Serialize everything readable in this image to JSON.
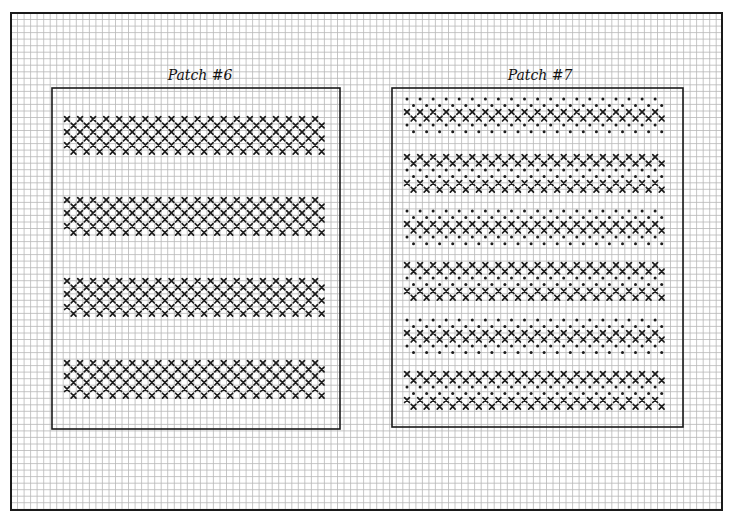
{
  "sheet": {
    "grid_cell_px": 6.53,
    "grid_color": "#b8b8b8",
    "border_color": "#1a1a1a",
    "stitch_color": "#1a1a1a"
  },
  "patches": [
    {
      "title": "Patch #6",
      "box": {
        "x": 52,
        "y": 88,
        "w": 288,
        "h": 341
      },
      "title_pos": {
        "x": 200,
        "y": 80
      },
      "stitch_x0": 67,
      "columns": 40,
      "bands": [
        {
          "y0": 119,
          "rows": [
            "X",
            "X",
            "X",
            "X",
            "X",
            "X"
          ]
        },
        {
          "y0": 200,
          "rows": [
            "X",
            "X",
            "X",
            "X",
            "X",
            "X"
          ]
        },
        {
          "y0": 281,
          "rows": [
            "X",
            "X",
            "X",
            "X",
            "X",
            "X"
          ]
        },
        {
          "y0": 363,
          "rows": [
            "X",
            "X",
            "X",
            "X",
            "X",
            "X"
          ]
        }
      ]
    },
    {
      "title": "Patch #7",
      "box": {
        "x": 392,
        "y": 88,
        "w": 291,
        "h": 339
      },
      "title_pos": {
        "x": 540,
        "y": 80
      },
      "stitch_x0": 407,
      "columns": 40,
      "bands": [
        {
          "y0": 99,
          "rows": [
            "D",
            "D",
            "X",
            "X",
            "D",
            "D"
          ]
        },
        {
          "y0": 157,
          "rows": [
            "X",
            "X",
            "D",
            "D",
            "X",
            "X"
          ]
        },
        {
          "y0": 211,
          "rows": [
            "D",
            "D",
            "X",
            "X",
            "D",
            "D"
          ]
        },
        {
          "y0": 265,
          "rows": [
            "X",
            "X",
            "D",
            "D",
            "X",
            "X"
          ]
        },
        {
          "y0": 320,
          "rows": [
            "D",
            "D",
            "X",
            "X",
            "D",
            "D"
          ]
        },
        {
          "y0": 374,
          "rows": [
            "X",
            "X",
            "D",
            "D",
            "X",
            "X"
          ]
        }
      ]
    }
  ],
  "legend": {
    "X": "cross-stitch",
    "D": "dot"
  }
}
